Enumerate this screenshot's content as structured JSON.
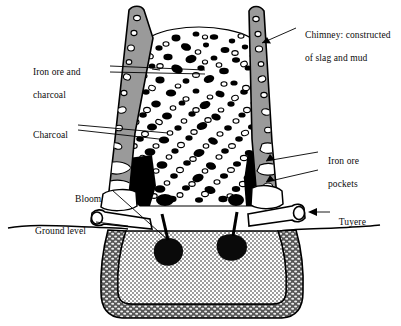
{
  "figure": {
    "background_color": "#ffffff",
    "line_color": "#000000",
    "chimney_fill": "#999999",
    "pit_fill": "#c9c9c9",
    "pit_wall_fill": "#4a4a4a",
    "charge_fill": "#ffffff",
    "charcoal_color": "#000000"
  },
  "labels": {
    "chimney": {
      "line1": "Chimney: constructed",
      "line2": "of slag and mud",
      "anchor": "right-top"
    },
    "iron_ore_and_charcoal": {
      "line1": "Iron ore and",
      "line2": "charcoal",
      "anchor": "left-upper"
    },
    "charcoal": {
      "line1": "Charcoal",
      "anchor": "left-middle"
    },
    "iron_ore_pockets": {
      "line1": "Iron ore",
      "line2": "pockets",
      "anchor": "right-middle"
    },
    "bloom": {
      "line1": "Bloom",
      "anchor": "left-lower"
    },
    "ground_level": {
      "line1": "Ground level",
      "anchor": "left-bottom"
    },
    "tuyere": {
      "line1": "Tuyere",
      "anchor": "right-lower"
    }
  }
}
